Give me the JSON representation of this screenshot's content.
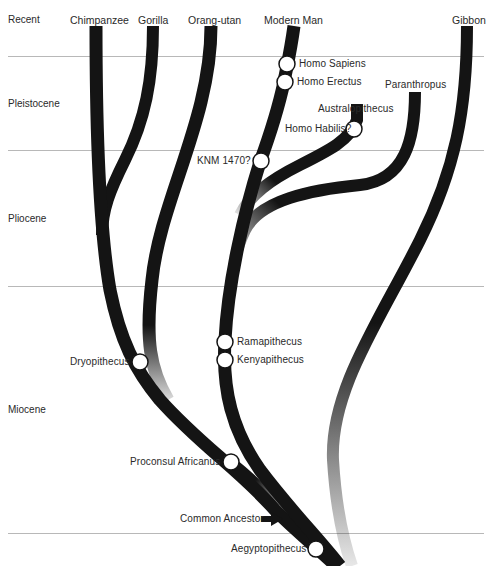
{
  "epochs": [
    {
      "label": "Recent"
    },
    {
      "label": "Pleistocene"
    },
    {
      "label": "Pliocene"
    },
    {
      "label": "Miocene"
    }
  ],
  "living_species": [
    {
      "label": "Chimpanzee"
    },
    {
      "label": "Gorilla"
    },
    {
      "label": "Orang-utan"
    },
    {
      "label": "Modern Man"
    },
    {
      "label": "Gibbon"
    }
  ],
  "fossils": [
    {
      "label": "Homo Sapiens"
    },
    {
      "label": "Homo Erectus"
    },
    {
      "label": "Australopithecus"
    },
    {
      "label": "Paranthropus"
    },
    {
      "label": "Homo Habilis?"
    },
    {
      "label": "KNM 1470?"
    },
    {
      "label": "Ramapithecus"
    },
    {
      "label": "Kenyapithecus"
    },
    {
      "label": "Dryopithecus"
    },
    {
      "label": "Proconsul Africanus"
    },
    {
      "label": "Common Ancestor"
    },
    {
      "label": "Aegyptopithecus"
    }
  ],
  "colors": {
    "branch": "#141414",
    "divider": "#b8b8b8",
    "text": "#2a2a2a",
    "node_fill": "#ffffff"
  }
}
